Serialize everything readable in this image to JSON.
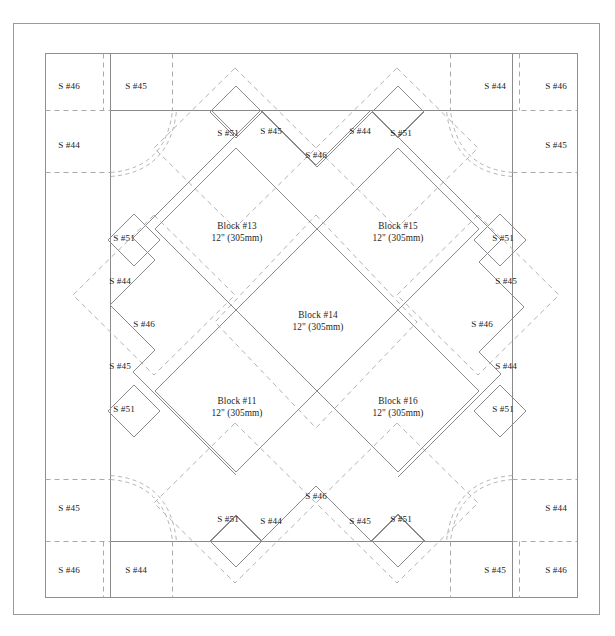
{
  "diagram": {
    "units_note": "12\" (305mm)",
    "colors": {
      "solid_line": "#8a8a8a",
      "dashed_line": "#a9a9a9",
      "frame_line": "#9a9a9a",
      "text": "#1c1c1c",
      "background": "#ffffff"
    },
    "frame": {
      "outer": {
        "x": 13,
        "y": 23,
        "w": 587,
        "h": 592
      },
      "inner": {
        "x": 45,
        "y": 53,
        "w": 533,
        "h": 545
      },
      "border_lines": {
        "left_x": 110,
        "right_x": 513,
        "top_y": 110,
        "bottom_y": 541
      }
    },
    "blocks": [
      {
        "name": "Block #13",
        "size": "12\" (305mm)",
        "cx": 237,
        "cy": 232
      },
      {
        "name": "Block #15",
        "size": "12\" (305mm)",
        "cx": 398,
        "cy": 232
      },
      {
        "name": "Block #14",
        "size": "12\" (305mm)",
        "cx": 318,
        "cy": 321
      },
      {
        "name": "Block #11",
        "size": "12\" (305mm)",
        "cx": 237,
        "cy": 407
      },
      {
        "name": "Block #16",
        "size": "12\" (305mm)",
        "cx": 398,
        "cy": 407
      }
    ],
    "sashing_labels": [
      {
        "label": "S #46",
        "cx": 69,
        "cy": 86
      },
      {
        "label": "S #45",
        "cx": 136,
        "cy": 86
      },
      {
        "label": "S #44",
        "cx": 495,
        "cy": 86
      },
      {
        "label": "S #46",
        "cx": 556,
        "cy": 86
      },
      {
        "label": "S #44",
        "cx": 69,
        "cy": 145
      },
      {
        "label": "S #45",
        "cx": 556,
        "cy": 145
      },
      {
        "label": "S #51",
        "cx": 228,
        "cy": 133
      },
      {
        "label": "S #45",
        "cx": 271,
        "cy": 131
      },
      {
        "label": "S #44",
        "cx": 360,
        "cy": 131
      },
      {
        "label": "S #51",
        "cx": 401,
        "cy": 133
      },
      {
        "label": "S #46",
        "cx": 316,
        "cy": 155
      },
      {
        "label": "S #51",
        "cx": 124,
        "cy": 238
      },
      {
        "label": "S #51",
        "cx": 503,
        "cy": 238
      },
      {
        "label": "S #44",
        "cx": 120,
        "cy": 281
      },
      {
        "label": "S #45",
        "cx": 506,
        "cy": 281
      },
      {
        "label": "S #46",
        "cx": 144,
        "cy": 324
      },
      {
        "label": "S #46",
        "cx": 482,
        "cy": 324
      },
      {
        "label": "S #45",
        "cx": 120,
        "cy": 366
      },
      {
        "label": "S #44",
        "cx": 506,
        "cy": 366
      },
      {
        "label": "S #51",
        "cx": 124,
        "cy": 409
      },
      {
        "label": "S #51",
        "cx": 503,
        "cy": 409
      },
      {
        "label": "S #46",
        "cx": 316,
        "cy": 496
      },
      {
        "label": "S #51",
        "cx": 228,
        "cy": 519
      },
      {
        "label": "S #44",
        "cx": 271,
        "cy": 521
      },
      {
        "label": "S #45",
        "cx": 360,
        "cy": 521
      },
      {
        "label": "S #51",
        "cx": 401,
        "cy": 519
      },
      {
        "label": "S #45",
        "cx": 69,
        "cy": 508
      },
      {
        "label": "S #44",
        "cx": 556,
        "cy": 508
      },
      {
        "label": "S #46",
        "cx": 69,
        "cy": 570
      },
      {
        "label": "S #44",
        "cx": 136,
        "cy": 570
      },
      {
        "label": "S #45",
        "cx": 495,
        "cy": 570
      },
      {
        "label": "S #46",
        "cx": 556,
        "cy": 570
      }
    ]
  }
}
